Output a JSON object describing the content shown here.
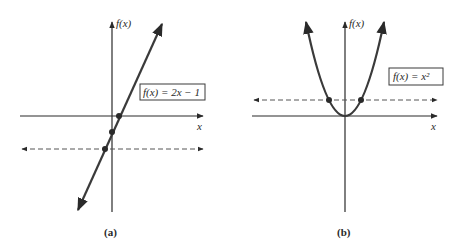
{
  "panels": [
    {
      "id": "a",
      "caption": "(a)",
      "y_axis_label": "f(x)",
      "x_axis_label": "x",
      "function_label": "f(x) = 2x − 1",
      "function_type": "linear"
    },
    {
      "id": "b",
      "caption": "(b)",
      "y_axis_label": "f(x)",
      "x_axis_label": "x",
      "function_label": "f(x) = x²",
      "function_type": "quadratic"
    }
  ],
  "colors": {
    "curve": "#3a3a3a",
    "axis": "#2a2a2a",
    "dashed": "#555555"
  }
}
